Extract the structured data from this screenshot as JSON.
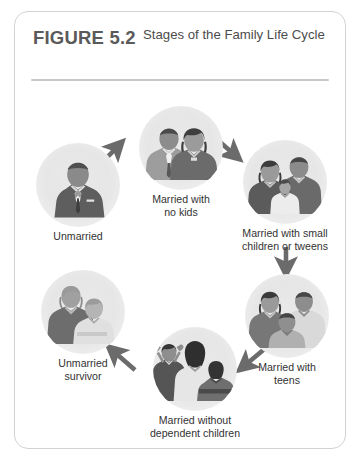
{
  "figure": {
    "number": "FIGURE 5.2",
    "title": "Stages of the Family Life Cycle"
  },
  "colors": {
    "card_border": "#d2d2d2",
    "divider": "#c9c9c9",
    "figure_number_text": "#5a5a5a",
    "title_text": "#4c4c4c",
    "label_text": "#333333",
    "arrow": "#6b6b6b",
    "photo_background": "#e6e6e6"
  },
  "diagram": {
    "type": "cycle-flow",
    "stages": [
      {
        "id": "unmarried",
        "label": "Unmarried",
        "image": "portrait-single-man-in-suit"
      },
      {
        "id": "married-no-kids",
        "label": "Married with\nno kids",
        "label_lines": [
          "Married with",
          "no kids"
        ],
        "image": "portrait-couple"
      },
      {
        "id": "small-children",
        "label": "Married with small\nchildren or tweens",
        "label_lines": [
          "Married with small",
          "children or tweens"
        ],
        "image": "portrait-couple-with-baby"
      },
      {
        "id": "teens",
        "label": "Married with\nteens",
        "label_lines": [
          "Married with",
          "teens"
        ],
        "image": "portrait-family-with-teen"
      },
      {
        "id": "without-dependent",
        "label": "Married without\ndependent children",
        "label_lines": [
          "Married without",
          "dependent children"
        ],
        "image": "portrait-adults-with-grown-children"
      },
      {
        "id": "survivor",
        "label": "Unmarried\nsurvivor",
        "label_lines": [
          "Unmarried",
          "survivor"
        ],
        "image": "portrait-elderly-couple"
      }
    ],
    "arrows": [
      {
        "id": "arrow-unmarried-to-no-kids",
        "from": "unmarried",
        "to": "married-no-kids",
        "direction": "up-right"
      },
      {
        "id": "arrow-no-kids-to-small-children",
        "from": "married-no-kids",
        "to": "small-children",
        "direction": "down-right"
      },
      {
        "id": "arrow-small-children-to-teens",
        "from": "small-children",
        "to": "teens",
        "direction": "down"
      },
      {
        "id": "arrow-teens-to-without-dependent",
        "from": "teens",
        "to": "without-dependent",
        "direction": "down-left"
      },
      {
        "id": "arrow-without-dependent-to-survivor",
        "from": "without-dependent",
        "to": "survivor",
        "direction": "up-left"
      }
    ]
  }
}
